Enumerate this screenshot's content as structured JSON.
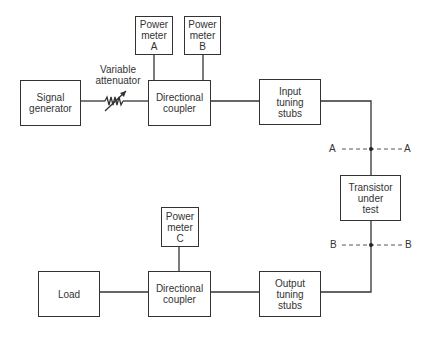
{
  "diagram": {
    "blocks": {
      "signal_generator": "Signal\ngenerator",
      "power_meter_a": "Power\nmeter\nA",
      "power_meter_b": "Power\nmeter\nB",
      "directional_coupler_top": "Directional\ncoupler",
      "input_tuning_stubs": "Input\ntuning\nstubs",
      "transistor": "Transistor\nunder\ntest",
      "load": "Load",
      "power_meter_c": "Power\nmeter\nC",
      "directional_coupler_bottom": "Directional\ncoupler",
      "output_tuning_stubs": "Output\ntuning\nstubs"
    },
    "labels": {
      "variable_attenuator": "Variable\nattenuator",
      "plane_a_left": "A",
      "plane_a_right": "A",
      "plane_b_left": "B",
      "plane_b_right": "B"
    },
    "line_color": "#333333"
  }
}
